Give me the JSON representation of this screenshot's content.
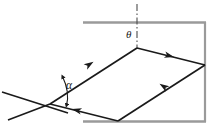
{
  "figure": {
    "type": "optics-ray-diagram",
    "background_color": "#ffffff",
    "labels": {
      "theta": "θ",
      "alpha": "α"
    },
    "colors": {
      "ray_stroke": "#1a1a1a",
      "slab_stroke": "#9a9a9a",
      "normal_stroke": "#4d4d4d",
      "label_color": "#1a1a1a"
    },
    "slab": {
      "name": "medium-boundary-rectangle",
      "stroke_width": 2,
      "top_edge": {
        "x1": 83,
        "y1": 22,
        "x2": 206,
        "y2": 22
      },
      "right_edge": {
        "x1": 205,
        "y1": 22,
        "x2": 205,
        "y2": 122
      },
      "bottom_edge": {
        "x1": 83,
        "y1": 122,
        "x2": 206,
        "y2": 122
      }
    },
    "normal_line": {
      "name": "normal-dash-dot-line",
      "x": 137,
      "y_top": 4,
      "y_bottom": 49,
      "dash_pattern": "7 2.5 1.5 2.5"
    },
    "ray_path": {
      "name": "ray-polyline",
      "stroke_width": 1.7,
      "points": [
        {
          "x": 8,
          "y": 120,
          "role": "incident-ray-start"
        },
        {
          "x": 50,
          "y": 104,
          "role": "entry-point-left"
        },
        {
          "x": 137,
          "y": 48,
          "role": "apex-top-vertex"
        },
        {
          "x": 205,
          "y": 65,
          "role": "right-vertex"
        },
        {
          "x": 118,
          "y": 121,
          "role": "bottom-vertex"
        },
        {
          "x": 50,
          "y": 104,
          "role": "return-to-entry-point"
        }
      ]
    },
    "stray_ray": {
      "name": "crossing-ray-segment",
      "x1": 2,
      "y1": 92,
      "x2": 68,
      "y2": 113
    },
    "arrowheads": [
      {
        "name": "arrowhead-upper-left-segment",
        "x": 90,
        "y": 64,
        "angle_deg": -32.8
      },
      {
        "name": "arrowhead-upper-right-segment",
        "x": 170,
        "y": 56,
        "angle_deg": 14.0
      },
      {
        "name": "arrowhead-lower-right-segment",
        "x": 163,
        "y": 86,
        "angle_deg": 213.5
      },
      {
        "name": "arrowhead-bottom-segment",
        "x": 76,
        "y": 110,
        "angle_deg": 194.0
      }
    ],
    "angle_arc_theta": {
      "name": "theta-angle-arc",
      "vertex_x": 137,
      "vertex_y": 48,
      "radius": 13
    },
    "angle_arc_alpha": {
      "name": "alpha-angle-double-arrow",
      "vertex_x": 50,
      "vertex_y": 104,
      "arc_start": {
        "x": 62,
        "y": 76
      },
      "arc_end": {
        "x": 66,
        "y": 105
      }
    }
  }
}
